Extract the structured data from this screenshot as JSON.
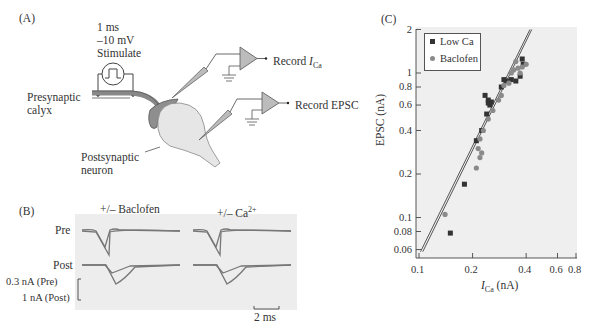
{
  "panel_a": {
    "label": "(A)",
    "stimulus": {
      "duration": "1 ms",
      "voltage": "–10 mV",
      "label": "Stimulate"
    },
    "presynaptic_label_1": "Presynaptic",
    "presynaptic_label_2": "calyx",
    "postsynaptic_label_1": "Postsynaptic",
    "postsynaptic_label_2": "neuron",
    "record_ica_prefix": "Record ",
    "record_ica_i": "I",
    "record_ica_sub": "Ca",
    "record_epsc": "Record EPSC"
  },
  "panel_b": {
    "label": "(B)",
    "col1_title": "+/– Baclofen",
    "col2_title_prefix": "+/– Ca",
    "col2_title_sup": "2+",
    "row_pre": "Pre",
    "row_post": "Post",
    "scale_pre": "0.3 nA (Pre)",
    "scale_post": "1 nA (Post)",
    "time_scale": "2 ms"
  },
  "panel_c": {
    "label": "(C)"
  },
  "chart_data": {
    "type": "scatter",
    "title": "",
    "xlabel": "I_Ca (nA)",
    "ylabel": "EPSC (nA)",
    "xscale": "log",
    "yscale": "log",
    "xlim": [
      0.1,
      0.8
    ],
    "ylim": [
      0.055,
      2
    ],
    "x_ticks": [
      "0.1",
      "0.2",
      "0.4",
      "0.6",
      "0.8"
    ],
    "y_ticks": [
      "0.06",
      "0.08",
      "0.1",
      "0.2",
      "0.4",
      "0.6",
      "0.8",
      "1",
      "2"
    ],
    "grid": false,
    "legend_position": "upper left",
    "legend": [
      "Low Ca",
      "Baclofen"
    ],
    "series": [
      {
        "name": "Low Ca",
        "marker": "square",
        "color": "#333333",
        "points": [
          [
            0.15,
            0.078
          ],
          [
            0.18,
            0.17
          ],
          [
            0.21,
            0.34
          ],
          [
            0.225,
            0.4
          ],
          [
            0.24,
            0.52
          ],
          [
            0.235,
            0.7
          ],
          [
            0.245,
            0.65
          ],
          [
            0.25,
            0.6
          ],
          [
            0.255,
            0.63
          ],
          [
            0.245,
            0.62
          ],
          [
            0.29,
            0.8
          ],
          [
            0.3,
            0.9
          ],
          [
            0.31,
            0.88
          ],
          [
            0.33,
            0.9
          ],
          [
            0.35,
            0.88
          ],
          [
            0.37,
            0.95
          ],
          [
            0.38,
            1.25
          ],
          [
            0.385,
            1.15
          ]
        ]
      },
      {
        "name": "Baclofen",
        "marker": "circle",
        "color": "#8a8a8a",
        "points": [
          [
            0.14,
            0.105
          ],
          [
            0.21,
            0.22
          ],
          [
            0.22,
            0.26
          ],
          [
            0.215,
            0.3
          ],
          [
            0.225,
            0.28
          ],
          [
            0.22,
            0.35
          ],
          [
            0.23,
            0.4
          ],
          [
            0.245,
            0.48
          ],
          [
            0.26,
            0.55
          ],
          [
            0.28,
            0.65
          ],
          [
            0.29,
            0.7
          ],
          [
            0.3,
            0.82
          ],
          [
            0.32,
            0.85
          ],
          [
            0.33,
            1.0
          ],
          [
            0.34,
            1.05
          ],
          [
            0.36,
            1.08
          ],
          [
            0.37,
            1.0
          ],
          [
            0.38,
            1.1
          ],
          [
            0.4,
            1.15
          ],
          [
            0.35,
            1.2
          ]
        ]
      }
    ],
    "fit_lines": [
      {
        "name": "Low Ca fit",
        "from": [
          0.102,
          0.058
        ],
        "to": [
          0.42,
          2.0
        ]
      },
      {
        "name": "Baclofen fit",
        "from": [
          0.105,
          0.058
        ],
        "to": [
          0.43,
          2.0
        ]
      }
    ]
  }
}
